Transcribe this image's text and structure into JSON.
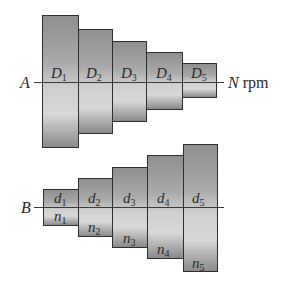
{
  "diagram": {
    "top_pulley": {
      "shaft_label": "A",
      "speed_label_var": "N",
      "speed_label_unit": "rpm",
      "steps": [
        {
          "var": "D",
          "sub": "1"
        },
        {
          "var": "D",
          "sub": "2"
        },
        {
          "var": "D",
          "sub": "3"
        },
        {
          "var": "D",
          "sub": "4"
        },
        {
          "var": "D",
          "sub": "5"
        }
      ]
    },
    "bottom_pulley": {
      "shaft_label": "B",
      "steps": [
        {
          "var": "d",
          "sub": "1",
          "speed_var": "n",
          "speed_sub": "1"
        },
        {
          "var": "d",
          "sub": "2",
          "speed_var": "n",
          "speed_sub": "2"
        },
        {
          "var": "d",
          "sub": "3",
          "speed_var": "n",
          "speed_sub": "3"
        },
        {
          "var": "d",
          "sub": "4",
          "speed_var": "n",
          "speed_sub": "4"
        },
        {
          "var": "d",
          "sub": "5",
          "speed_var": "n",
          "speed_sub": "5"
        }
      ]
    }
  }
}
